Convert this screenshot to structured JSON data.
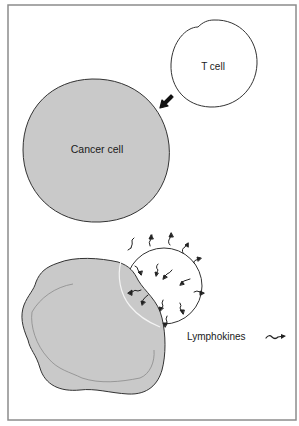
{
  "diagram": {
    "colors": {
      "background": "#ffffff",
      "frame": "#8c8c8c",
      "cell_outline": "#333333",
      "cancer_fill": "#c9c9c9",
      "tcell_fill": "#ffffff",
      "arrow": "#111111",
      "lymphokine": "#222222"
    },
    "labels": {
      "t_cell": "T cell",
      "cancer_cell": "Cancer cell",
      "lymphokines": "Lymphokines"
    },
    "icons": {
      "attack_arrow": "arrow-down-left-icon",
      "lymphokine_legend": "lymphokine-squiggle-icon"
    },
    "panels": [
      {
        "name": "before-contact",
        "elements": [
          "t_cell",
          "cancer_cell",
          "attack_arrow"
        ]
      },
      {
        "name": "after-contact",
        "elements": [
          "t_cell_bound",
          "irregular_cancer_cell",
          "lymphokines"
        ]
      }
    ]
  }
}
